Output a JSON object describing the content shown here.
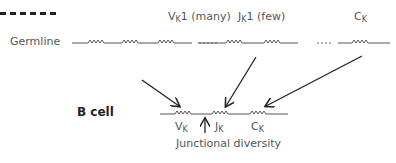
{
  "germline_label": "Germline",
  "bcell_label": "B cell",
  "segments_top": {
    "v": {
      "base": "V",
      "sub": "K",
      "suffix": "1 (many)"
    },
    "j": {
      "base": "J",
      "sub": "K",
      "suffix": "1 (few)"
    },
    "c": {
      "base": "C",
      "sub": "K",
      "suffix": ""
    }
  },
  "segments_bottom": {
    "v": {
      "base": "V",
      "sub": "K"
    },
    "j": {
      "base": "J",
      "sub": "K"
    },
    "c": {
      "base": "C",
      "sub": "K"
    }
  },
  "junctional_label": "Junctional diversity",
  "colors": {
    "line": "#444444",
    "arrow": "#222222"
  }
}
